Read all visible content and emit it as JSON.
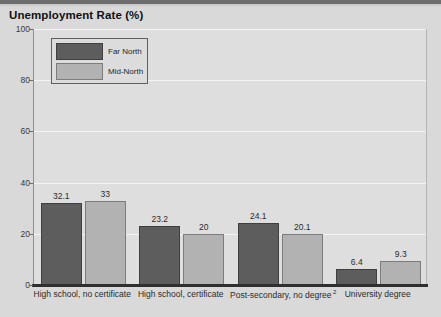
{
  "chart_data": {
    "type": "bar",
    "title": "Unemployment Rate (%)",
    "xlabel": "",
    "ylabel": "",
    "ylim": [
      0,
      100
    ],
    "yticks": [
      0,
      20,
      40,
      60,
      80,
      100
    ],
    "grid": true,
    "legend_position": "upper-left-inside",
    "categories": [
      "High school, no certificate",
      "High school, certificate",
      "Post-secondary, no degree",
      "University degree"
    ],
    "category_superscripts": [
      "",
      "",
      "2",
      ""
    ],
    "series": [
      {
        "name": "Far North",
        "color": "#5d5d5d",
        "values": [
          32.1,
          23.2,
          24.1,
          6.4
        ]
      },
      {
        "name": "Mid-North",
        "color": "#b2b2b2",
        "values": [
          33,
          20,
          20.1,
          9.3
        ]
      }
    ],
    "value_labels": [
      [
        "32.1",
        "23.2",
        "24.1",
        "6.4"
      ],
      [
        "33",
        "20",
        "20.1",
        "9.3"
      ]
    ]
  },
  "axis": {
    "y_tick_labels": [
      "100",
      "80",
      "60",
      "40",
      "20",
      "0"
    ]
  },
  "legend": {
    "items": [
      {
        "label": "Far North"
      },
      {
        "label": "Mid-North"
      }
    ]
  },
  "colors": {
    "far_north": "#5d5d5d",
    "mid_north": "#b2b2b2",
    "plot_background": "#dedede",
    "page_background": "#d9d9d9",
    "gridline": "#f4f4f4",
    "axis": "#2f2f2f"
  }
}
